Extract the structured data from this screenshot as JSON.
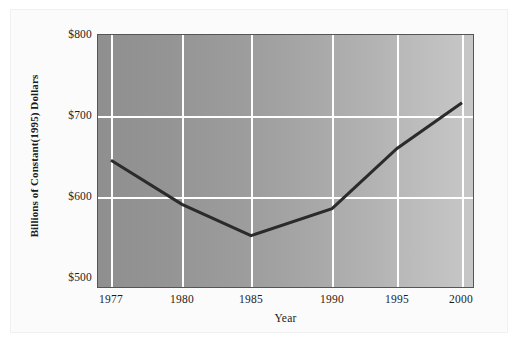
{
  "chart_data": {
    "type": "line",
    "title": "",
    "xlabel": "Year",
    "ylabel": "Billions of Constant(1995) Dollars",
    "x": [
      1977,
      1980,
      1985,
      1990,
      1995,
      2000
    ],
    "categories": [
      "1977",
      "1980",
      "1985",
      "1990",
      "1995",
      "2000"
    ],
    "values": [
      652,
      600,
      563,
      595,
      666,
      720
    ],
    "series": [
      {
        "name": "Billions of Constant(1995) Dollars",
        "values": [
          652,
          600,
          563,
          595,
          666,
          720
        ]
      }
    ],
    "xlim": [
      1977,
      2000
    ],
    "ylim": [
      500,
      800
    ],
    "ytick_values": [
      800,
      700,
      600,
      500
    ],
    "ytick_labels": [
      "$800",
      "$700",
      "$600",
      "$500"
    ],
    "xtick_labels": [
      "1977",
      "1980",
      "1985",
      "1990",
      "1995",
      "2000"
    ],
    "grid": true,
    "grid_color": "#ffffff",
    "legend": "none",
    "line_color": "#2b2b2b",
    "line_width": 3,
    "plot_background": "gray gradient, dark at left to light at right",
    "plot_background_left": "#8f8f8f",
    "plot_background_right": "#c7c7c7",
    "figure_background": "#fbfbfb",
    "axis_color": "#555555"
  },
  "axes": {
    "y_title": "Billions of Constant(1995) Dollars",
    "x_title": "Year",
    "y_ticks": [
      "$800",
      "$700",
      "$600",
      "$500"
    ],
    "x_ticks": [
      "1977",
      "1980",
      "1985",
      "1990",
      "1995",
      "2000"
    ]
  }
}
